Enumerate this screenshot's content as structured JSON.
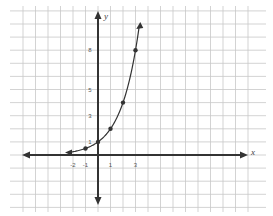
{
  "chart_data": {
    "type": "line",
    "title": "",
    "xlabel": "x",
    "ylabel": "y",
    "function": "y = 2^x",
    "x_ticks": [
      -2,
      -1,
      1,
      3
    ],
    "x_tick_labels": [
      "-2",
      "-1",
      "1",
      "3"
    ],
    "y_ticks": [
      1,
      3,
      5,
      8
    ],
    "y_tick_labels": [
      "1",
      "3",
      "5",
      "8"
    ],
    "points": [
      {
        "x": -1,
        "y": 0.5
      },
      {
        "x": 0,
        "y": 1
      },
      {
        "x": 1,
        "y": 2
      },
      {
        "x": 2,
        "y": 4
      },
      {
        "x": 3,
        "y": 8
      }
    ],
    "xlim": [
      -7,
      12
    ],
    "ylim": [
      -11,
      12
    ],
    "grid": true,
    "legend": null
  },
  "axes": {
    "x_label": "x",
    "y_label": "y"
  }
}
